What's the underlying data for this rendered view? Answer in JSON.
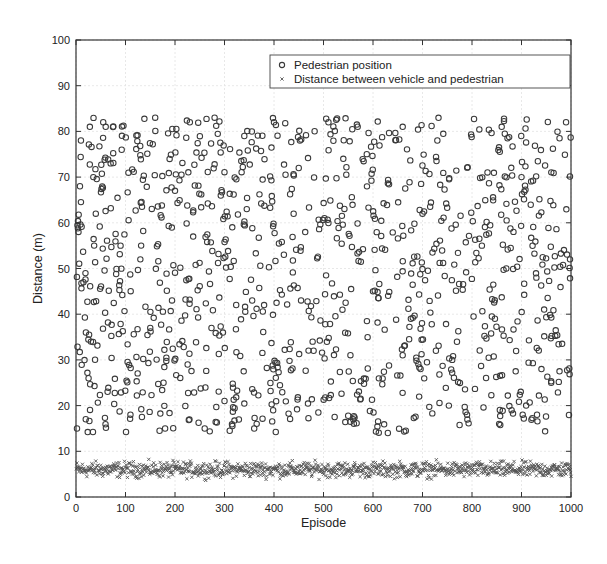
{
  "chart_data": {
    "type": "scatter",
    "title": "",
    "xlabel": "Episode",
    "ylabel": "Distance (m)",
    "xlim": [
      0,
      1000
    ],
    "ylim": [
      0,
      100
    ],
    "xticks": [
      0,
      100,
      200,
      300,
      400,
      500,
      600,
      700,
      800,
      900,
      1000
    ],
    "yticks": [
      0,
      10,
      20,
      30,
      40,
      50,
      60,
      70,
      80,
      90,
      100
    ],
    "grid": true,
    "legend_position": "upper right",
    "series": [
      {
        "name": "Pedestrian position",
        "marker": "circle-open",
        "color": "#3a3a3a",
        "n_points": 1000,
        "x_range": [
          1,
          1000
        ],
        "y_range": [
          14,
          83
        ],
        "distribution": "approximately uniform",
        "sample_points": [
          [
            2,
            15
          ],
          [
            5,
            58
          ],
          [
            8,
            68
          ],
          [
            10,
            78
          ],
          [
            15,
            47
          ],
          [
            20,
            36
          ],
          [
            28,
            81
          ],
          [
            35,
            70
          ],
          [
            40,
            62
          ],
          [
            55,
            82
          ],
          [
            60,
            81
          ],
          [
            70,
            73
          ],
          [
            90,
            55
          ],
          [
            110,
            18
          ],
          [
            130,
            52
          ],
          [
            150,
            37
          ],
          [
            160,
            83
          ],
          [
            180,
            15
          ],
          [
            200,
            67
          ],
          [
            230,
            82
          ],
          [
            260,
            15
          ],
          [
            280,
            83
          ],
          [
            300,
            21
          ],
          [
            340,
            79
          ],
          [
            360,
            15
          ],
          [
            380,
            42
          ],
          [
            400,
            82
          ],
          [
            420,
            53
          ],
          [
            450,
            72
          ],
          [
            480,
            32
          ],
          [
            510,
            82
          ],
          [
            540,
            74
          ],
          [
            560,
            17
          ],
          [
            600,
            45
          ],
          [
            630,
            14
          ],
          [
            660,
            81
          ],
          [
            700,
            62
          ],
          [
            730,
            78
          ],
          [
            760,
            30
          ],
          [
            790,
            18
          ],
          [
            820,
            55
          ],
          [
            860,
            81
          ],
          [
            880,
            19
          ],
          [
            900,
            70
          ],
          [
            930,
            48
          ],
          [
            960,
            25
          ],
          [
            990,
            82
          ],
          [
            998,
            52
          ]
        ]
      },
      {
        "name": "Distance between vehicle and pedestrian",
        "marker": "x",
        "color": "#555555",
        "n_points": 1000,
        "x_range": [
          1,
          1000
        ],
        "y_range": [
          3.5,
          8.5
        ],
        "mean": 6,
        "distribution": "tight band around ~6 m"
      }
    ]
  }
}
